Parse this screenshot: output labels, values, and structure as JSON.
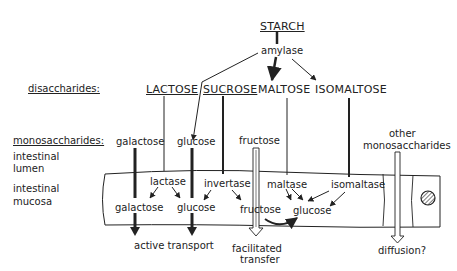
{
  "diagram": {
    "source": {
      "label": "STARCH"
    },
    "enzyme_top": {
      "label": "amylase"
    },
    "row_labels": {
      "disaccharides": "disaccharides:",
      "monosaccharides": "monosaccharides:",
      "lumen": [
        "intestinal",
        "lumen"
      ],
      "mucosa": [
        "intestinal",
        "mucosa"
      ]
    },
    "disaccharides": [
      {
        "label": "LACTOSE",
        "underlined": true
      },
      {
        "label": "SUCROSE",
        "underlined": true
      },
      {
        "label": "MALTOSE",
        "underlined": false
      },
      {
        "label": "ISOMALTOSE",
        "underlined": false
      }
    ],
    "lumen_monosaccharides": [
      {
        "label": "galactose"
      },
      {
        "label": "glucose"
      },
      {
        "label": "fructose"
      },
      {
        "label": "other"
      },
      {
        "label": "monosaccharides"
      }
    ],
    "mucosal_enzymes": [
      {
        "label": "lactase"
      },
      {
        "label": "invertase"
      },
      {
        "label": "maltase"
      },
      {
        "label": "isomaltase"
      }
    ],
    "mucosal_products": [
      {
        "label": "galactose"
      },
      {
        "label": "glucose"
      },
      {
        "label": "fructose"
      },
      {
        "label": "glucose"
      }
    ],
    "transport": [
      {
        "label": "active transport"
      },
      {
        "label": "facilitated"
      },
      {
        "label": "transfer"
      },
      {
        "label": "diffusion?"
      }
    ],
    "colors": {
      "ink": "#222222",
      "background": "#ffffff"
    }
  }
}
